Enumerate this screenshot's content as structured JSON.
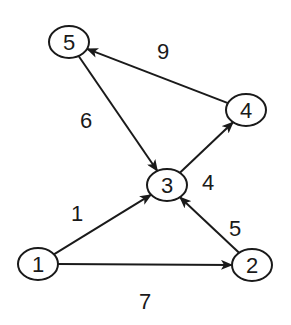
{
  "diagram": {
    "type": "directed-weighted-graph",
    "colors": {
      "stroke": "#1a1a1a",
      "background": "#ffffff",
      "node_fill": "#ffffff"
    },
    "nodes": [
      {
        "id": "1",
        "label": "1",
        "x": 38,
        "y": 264,
        "rx": 20,
        "ry": 16
      },
      {
        "id": "2",
        "label": "2",
        "x": 252,
        "y": 265,
        "rx": 20,
        "ry": 16
      },
      {
        "id": "3",
        "label": "3",
        "x": 167,
        "y": 185,
        "rx": 20,
        "ry": 16
      },
      {
        "id": "4",
        "label": "4",
        "x": 246,
        "y": 110,
        "rx": 20,
        "ry": 16
      },
      {
        "id": "5",
        "label": "5",
        "x": 69,
        "y": 42,
        "rx": 20,
        "ry": 16
      }
    ],
    "edges": [
      {
        "from": "1",
        "to": "3",
        "weight": "1",
        "label_x": 77,
        "label_y": 221
      },
      {
        "from": "1",
        "to": "2",
        "weight": "7",
        "label_x": 145,
        "label_y": 309
      },
      {
        "from": "2",
        "to": "3",
        "weight": "5",
        "label_x": 235,
        "label_y": 236
      },
      {
        "from": "3",
        "to": "4",
        "weight": "4",
        "label_x": 208,
        "label_y": 190
      },
      {
        "from": "4",
        "to": "5",
        "weight": "9",
        "label_x": 163,
        "label_y": 59
      },
      {
        "from": "5",
        "to": "3",
        "weight": "6",
        "label_x": 86,
        "label_y": 128
      }
    ]
  }
}
